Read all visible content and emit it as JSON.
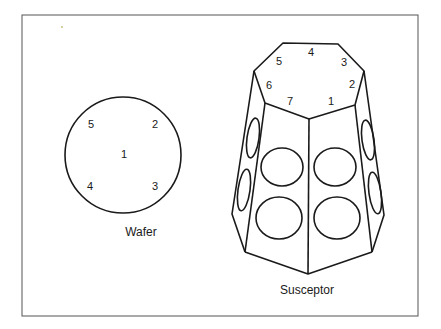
{
  "figure": {
    "wafer": {
      "caption": "Wafer",
      "positions": [
        "1",
        "2",
        "3",
        "4",
        "5"
      ]
    },
    "susceptor": {
      "caption": "Susceptor",
      "facets": [
        "1",
        "2",
        "3",
        "4",
        "5",
        "6",
        "7"
      ]
    },
    "colors": {
      "line": "#1a1a1a",
      "background": "#ffffff",
      "frame": "#555555"
    }
  }
}
